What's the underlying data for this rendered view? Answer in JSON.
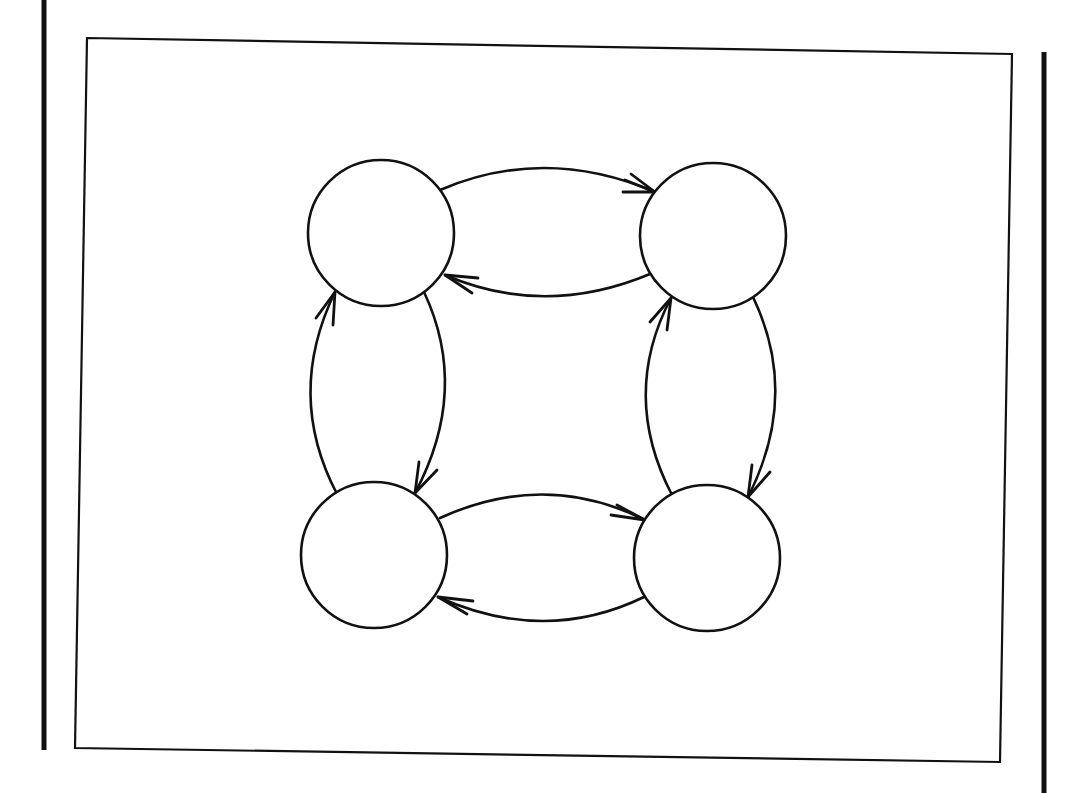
{
  "diagram": {
    "title": "",
    "type": "state-transition-graph",
    "colors": {
      "background": "#ffffff",
      "stroke": "#111111"
    },
    "frame": {
      "outer_left_bar": {
        "x": 44,
        "y1": 0,
        "y2": 750
      },
      "outer_right_bar": {
        "x": 1044,
        "y1": 52,
        "y2": 793
      },
      "inner_box": {
        "points": "87,38 1012,54 1000,762 75,748"
      }
    },
    "nodes": [
      {
        "id": "top-left",
        "label": "",
        "cx": 381,
        "cy": 233,
        "r": 73
      },
      {
        "id": "top-right",
        "label": "",
        "cx": 713,
        "cy": 236,
        "r": 73
      },
      {
        "id": "bottom-left",
        "label": "",
        "cx": 374,
        "cy": 555,
        "r": 73
      },
      {
        "id": "bottom-right",
        "label": "",
        "cx": 707,
        "cy": 558,
        "r": 73
      }
    ],
    "edges": [
      {
        "from": "top-left",
        "to": "top-right",
        "direction": "right",
        "path": "M 440 190 Q 545 145 655 192",
        "arrow": "M 625 180 L 655 192 L 623 192 M 655 192 L 631 174"
      },
      {
        "from": "top-right",
        "to": "top-left",
        "direction": "left",
        "path": "M 650 274 Q 545 318 445 275",
        "arrow": "M 478 278 L 445 275 L 472 293 M 445 275 L 478 278"
      },
      {
        "from": "top-left",
        "to": "bottom-left",
        "direction": "down",
        "path": "M 424 292 Q 470 390 415 493",
        "arrow": "M 419 462 L 415 493 L 437 470"
      },
      {
        "from": "bottom-left",
        "to": "top-left",
        "direction": "up",
        "path": "M 337 494 Q 285 395 335 292",
        "arrow": "M 316 318 L 335 292 L 333 325"
      },
      {
        "from": "top-right",
        "to": "bottom-right",
        "direction": "down",
        "path": "M 753 297 Q 800 395 748 497",
        "arrow": "M 752 465 L 748 497 L 770 472"
      },
      {
        "from": "bottom-right",
        "to": "top-right",
        "direction": "up",
        "path": "M 672 495 Q 620 395 671 298",
        "arrow": "M 650 322 L 671 298 L 667 330"
      },
      {
        "from": "bottom-left",
        "to": "bottom-right",
        "direction": "right",
        "path": "M 440 518 Q 545 470 645 520",
        "arrow": "M 617 505 L 645 520 L 611 515"
      },
      {
        "from": "bottom-right",
        "to": "bottom-left",
        "direction": "left",
        "path": "M 644 597 Q 545 645 438 597",
        "arrow": "M 473 601 L 438 597 L 467 614"
      }
    ]
  }
}
